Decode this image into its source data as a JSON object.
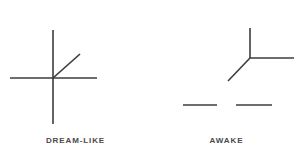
{
  "figure": {
    "title": "",
    "background_color": "#ffffff",
    "stroke_color": "#3c3c3c",
    "label_color": "#4a4a4a",
    "width": 302,
    "height": 157
  },
  "panels": [
    {
      "id": "dream-like",
      "label": "DREAM-LIKE",
      "description": "Cross with diagonal ray",
      "strokes": [
        {
          "name": "horizontal-axis",
          "x1": 10,
          "y1": 78,
          "x2": 97,
          "y2": 78,
          "width": 1.6
        },
        {
          "name": "vertical-axis",
          "x1": 53,
          "y1": 30,
          "x2": 53,
          "y2": 124,
          "width": 1.6
        },
        {
          "name": "diagonal-ray",
          "x1": 53,
          "y1": 78,
          "x2": 80,
          "y2": 54,
          "width": 1.6
        }
      ]
    },
    {
      "id": "awake",
      "label": "AWAKE",
      "description": "Three-way junction with two detached dashes",
      "strokes": [
        {
          "name": "vertical-arm",
          "x1": 250,
          "y1": 28,
          "x2": 250,
          "y2": 58,
          "width": 1.6
        },
        {
          "name": "horizontal-arm",
          "x1": 250,
          "y1": 58,
          "x2": 294,
          "y2": 58,
          "width": 1.6
        },
        {
          "name": "diagonal-arm",
          "x1": 250,
          "y1": 58,
          "x2": 228,
          "y2": 81,
          "width": 1.6
        },
        {
          "name": "dash-left",
          "x1": 183,
          "y1": 105,
          "x2": 217,
          "y2": 105,
          "width": 1.6
        },
        {
          "name": "dash-right",
          "x1": 236,
          "y1": 105,
          "x2": 272,
          "y2": 105,
          "width": 1.6
        }
      ]
    }
  ],
  "labels": {
    "dream_like": "DREAM-LIKE",
    "awake": "AWAKE"
  }
}
